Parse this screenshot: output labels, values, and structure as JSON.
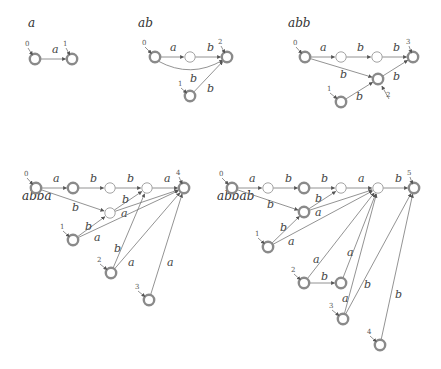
{
  "diagrams": [
    {
      "title": "a",
      "title_pos": [
        28,
        27
      ],
      "nodes": [
        {
          "id": "s0",
          "x": 35,
          "y": 59,
          "type": "init",
          "label": "0",
          "label_pos": [
            26,
            46
          ]
        },
        {
          "id": "s1",
          "x": 72,
          "y": 59,
          "type": "init",
          "label": "1",
          "label_pos": [
            64,
            46
          ]
        }
      ],
      "edges": [
        {
          "from": "s0",
          "to": "s1",
          "label": "a",
          "label_pos": [
            52,
            53
          ]
        }
      ]
    },
    {
      "title": "ab",
      "title_pos": [
        138,
        27
      ],
      "nodes": [
        {
          "id": "s0",
          "x": 155,
          "y": 57,
          "type": "init",
          "label": "0",
          "label_pos": [
            143,
            45
          ]
        },
        {
          "id": "m1",
          "x": 190,
          "y": 57,
          "type": "plain"
        },
        {
          "id": "f2",
          "x": 227,
          "y": 57,
          "type": "init",
          "label": "2",
          "label_pos": [
            219,
            44
          ]
        },
        {
          "id": "s1",
          "x": 190,
          "y": 96,
          "type": "init",
          "label": "1",
          "label_pos": [
            179,
            86
          ]
        }
      ],
      "edges": [
        {
          "from": "s0",
          "to": "m1",
          "label": "a",
          "label_pos": [
            170,
            51
          ]
        },
        {
          "from": "m1",
          "to": "f2",
          "label": "b",
          "label_pos": [
            207,
            51
          ]
        },
        {
          "from": "s0",
          "to": "f2",
          "label": "b",
          "label_pos": [
            190,
            82
          ],
          "curve": true
        },
        {
          "from": "s1",
          "to": "f2",
          "label": "b",
          "label_pos": [
            207,
            92
          ]
        }
      ]
    },
    {
      "title": "abb",
      "title_pos": [
        288,
        27
      ],
      "nodes": [
        {
          "id": "s0",
          "x": 305,
          "y": 57,
          "type": "init",
          "label": "0",
          "label_pos": [
            294,
            45
          ]
        },
        {
          "id": "m1",
          "x": 341,
          "y": 57,
          "type": "plain"
        },
        {
          "id": "m2",
          "x": 377,
          "y": 57,
          "type": "plain"
        },
        {
          "id": "f3",
          "x": 413,
          "y": 57,
          "type": "init",
          "label": "3",
          "label_pos": [
            407,
            44
          ]
        },
        {
          "id": "s2",
          "x": 378,
          "y": 79,
          "type": "init",
          "label": "2",
          "label_pos": [
            387,
            97
          ]
        },
        {
          "id": "s1",
          "x": 341,
          "y": 102,
          "type": "init",
          "label": "1",
          "label_pos": [
            328,
            91
          ]
        }
      ],
      "edges": [
        {
          "from": "s0",
          "to": "m1",
          "label": "a",
          "label_pos": [
            320,
            51
          ]
        },
        {
          "from": "m1",
          "to": "m2",
          "label": "b",
          "label_pos": [
            357,
            51
          ]
        },
        {
          "from": "m2",
          "to": "f3",
          "label": "b",
          "label_pos": [
            393,
            51
          ]
        },
        {
          "from": "s0",
          "to": "s2",
          "label": "b",
          "label_pos": [
            340,
            78
          ]
        },
        {
          "from": "s2",
          "to": "f3",
          "label": "b",
          "label_pos": [
            393,
            80
          ]
        },
        {
          "from": "s1",
          "to": "s2",
          "label": "b",
          "label_pos": [
            356,
            100
          ]
        }
      ]
    },
    {
      "title": "abba",
      "title_pos": [
        22,
        200
      ],
      "nodes": [
        {
          "id": "s0",
          "x": 36,
          "y": 188,
          "type": "init",
          "label": "0",
          "label_pos": [
            25,
            176
          ]
        },
        {
          "id": "n1",
          "x": 73,
          "y": 188,
          "type": "init"
        },
        {
          "id": "n2",
          "x": 110,
          "y": 188,
          "type": "plain"
        },
        {
          "id": "n3",
          "x": 147,
          "y": 188,
          "type": "plain"
        },
        {
          "id": "f4",
          "x": 184,
          "y": 188,
          "type": "init",
          "label": "4",
          "label_pos": [
            177,
            175
          ]
        },
        {
          "id": "mid",
          "x": 110,
          "y": 213,
          "type": "plain"
        },
        {
          "id": "s1",
          "x": 73,
          "y": 240,
          "type": "init",
          "label": "1",
          "label_pos": [
            61,
            229
          ]
        },
        {
          "id": "s2",
          "x": 111,
          "y": 273,
          "type": "init",
          "label": "2",
          "label_pos": [
            98,
            262
          ]
        },
        {
          "id": "s3",
          "x": 149,
          "y": 300,
          "type": "init",
          "label": "3",
          "label_pos": [
            136,
            289
          ]
        }
      ],
      "edges": [
        {
          "from": "s0",
          "to": "n1",
          "label": "a",
          "label_pos": [
            53,
            182
          ]
        },
        {
          "from": "n1",
          "to": "n2",
          "label": "b",
          "label_pos": [
            90,
            182
          ]
        },
        {
          "from": "n2",
          "to": "n3",
          "label": "b",
          "label_pos": [
            127,
            182
          ]
        },
        {
          "from": "n3",
          "to": "f4",
          "label": "a",
          "label_pos": [
            164,
            182
          ]
        },
        {
          "from": "s0",
          "to": "mid",
          "label": "b",
          "label_pos": [
            72,
            211
          ]
        },
        {
          "from": "mid",
          "to": "n3",
          "label": "b",
          "label_pos": [
            122,
            203
          ]
        },
        {
          "from": "mid",
          "to": "f4",
          "label": "a",
          "label_pos": [
            121,
            217
          ]
        },
        {
          "from": "s1",
          "to": "mid",
          "label": "b",
          "label_pos": [
            85,
            230
          ]
        },
        {
          "from": "s1",
          "to": "f4",
          "label": "a",
          "label_pos": [
            94,
            241
          ]
        },
        {
          "from": "s2",
          "to": "n3",
          "label": "b",
          "label_pos": [
            114,
            252
          ]
        },
        {
          "from": "s2",
          "to": "f4",
          "label": "a",
          "label_pos": [
            128,
            266
          ]
        },
        {
          "from": "s3",
          "to": "f4",
          "label": "a",
          "label_pos": [
            167,
            266
          ]
        }
      ]
    },
    {
      "title": "abbab",
      "title_pos": [
        217,
        200
      ],
      "nodes": [
        {
          "id": "s0",
          "x": 232,
          "y": 188,
          "type": "init",
          "label": "0",
          "label_pos": [
            220,
            176
          ]
        },
        {
          "id": "n1",
          "x": 268,
          "y": 188,
          "type": "plain"
        },
        {
          "id": "n2",
          "x": 304,
          "y": 188,
          "type": "init"
        },
        {
          "id": "n3",
          "x": 341,
          "y": 188,
          "type": "plain"
        },
        {
          "id": "n4",
          "x": 378,
          "y": 188,
          "type": "plain"
        },
        {
          "id": "f5",
          "x": 414,
          "y": 188,
          "type": "init",
          "label": "5",
          "label_pos": [
            408,
            175
          ]
        },
        {
          "id": "mid",
          "x": 304,
          "y": 212,
          "type": "init"
        },
        {
          "id": "s1",
          "x": 268,
          "y": 247,
          "type": "init",
          "label": "1",
          "label_pos": [
            256,
            236
          ]
        },
        {
          "id": "s2",
          "x": 304,
          "y": 283,
          "type": "init",
          "label": "2",
          "label_pos": [
            292,
            272
          ]
        },
        {
          "id": "s2b",
          "x": 341,
          "y": 283,
          "type": "init"
        },
        {
          "id": "s3",
          "x": 343,
          "y": 319,
          "type": "init",
          "label": "3",
          "label_pos": [
            330,
            308
          ]
        },
        {
          "id": "s4",
          "x": 380,
          "y": 345,
          "type": "init",
          "label": "4",
          "label_pos": [
            368,
            334
          ]
        }
      ],
      "edges": [
        {
          "from": "s0",
          "to": "n1",
          "label": "a",
          "label_pos": [
            249,
            182
          ]
        },
        {
          "from": "n1",
          "to": "n2",
          "label": "b",
          "label_pos": [
            285,
            182
          ]
        },
        {
          "from": "n2",
          "to": "n3",
          "label": "b",
          "label_pos": [
            321,
            182
          ]
        },
        {
          "from": "n3",
          "to": "n4",
          "label": "a",
          "label_pos": [
            358,
            182
          ]
        },
        {
          "from": "n4",
          "to": "f5",
          "label": "b",
          "label_pos": [
            395,
            182
          ]
        },
        {
          "from": "s0",
          "to": "mid",
          "label": "b",
          "label_pos": [
            267,
            208
          ]
        },
        {
          "from": "mid",
          "to": "n3",
          "label": "b",
          "label_pos": [
            315,
            202
          ]
        },
        {
          "from": "mid",
          "to": "n4",
          "label": "a",
          "label_pos": [
            315,
            216
          ]
        },
        {
          "from": "s1",
          "to": "mid",
          "label": "b",
          "label_pos": [
            280,
            231
          ]
        },
        {
          "from": "s1",
          "to": "n4",
          "label": "a",
          "label_pos": [
            288,
            245
          ]
        },
        {
          "from": "s2",
          "to": "n4",
          "label": "a",
          "label_pos": [
            313,
            263
          ]
        },
        {
          "from": "s2",
          "to": "s2b",
          "label": "b",
          "label_pos": [
            321,
            280
          ]
        },
        {
          "from": "s2b",
          "to": "n4",
          "label": "a",
          "label_pos": [
            347,
            256
          ]
        },
        {
          "from": "s3",
          "to": "n4",
          "label": "a",
          "label_pos": [
            342,
            302
          ]
        },
        {
          "from": "s3",
          "to": "f5",
          "label": "b",
          "label_pos": [
            364,
            288
          ]
        },
        {
          "from": "s4",
          "to": "f5",
          "label": "b",
          "label_pos": [
            395,
            298
          ]
        }
      ]
    }
  ]
}
